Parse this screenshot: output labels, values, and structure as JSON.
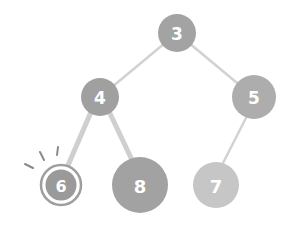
{
  "diagram": {
    "type": "binary-tree",
    "highlighted_node": "6",
    "colors": {
      "background": "#ffffff",
      "edge": "#d2d2d2",
      "edge_thick": "#cfcfcf",
      "highlight_ring": "#9e9e9e",
      "highlight_marks": "#8a8a8a",
      "label": "#ffffff"
    },
    "nodes": [
      {
        "id": "3",
        "label": "3",
        "cx": 177,
        "cy": 33,
        "r": 19,
        "fill": "#a3a3a3"
      },
      {
        "id": "4",
        "label": "4",
        "cx": 100,
        "cy": 97,
        "r": 19,
        "fill": "#a0a0a0"
      },
      {
        "id": "5",
        "label": "5",
        "cx": 254,
        "cy": 97,
        "r": 22,
        "fill": "#adadad"
      },
      {
        "id": "6",
        "label": "6",
        "cx": 61,
        "cy": 185,
        "r": 15,
        "fill": "#9a9a9a"
      },
      {
        "id": "8",
        "label": "8",
        "cx": 140,
        "cy": 185,
        "r": 28,
        "fill": "#a2a2a2"
      },
      {
        "id": "7",
        "label": "7",
        "cx": 216,
        "cy": 185,
        "r": 23,
        "fill": "#c6c6c6"
      }
    ],
    "edges": [
      {
        "from": "3",
        "to": "4",
        "width": 2.5
      },
      {
        "from": "3",
        "to": "5",
        "width": 2.5
      },
      {
        "from": "4",
        "to": "6",
        "width": 5
      },
      {
        "from": "4",
        "to": "8",
        "width": 5
      },
      {
        "from": "5",
        "to": "7",
        "width": 2.5
      }
    ]
  }
}
